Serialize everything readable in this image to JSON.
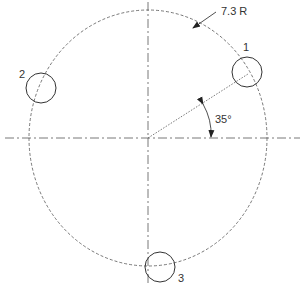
{
  "diagram": {
    "radius_label": "7.3 R",
    "angle_label": "35°",
    "holes": [
      {
        "label": "1"
      },
      {
        "label": "2"
      },
      {
        "label": "3"
      }
    ],
    "colors": {
      "line": "#333333",
      "background": "#ffffff"
    }
  }
}
